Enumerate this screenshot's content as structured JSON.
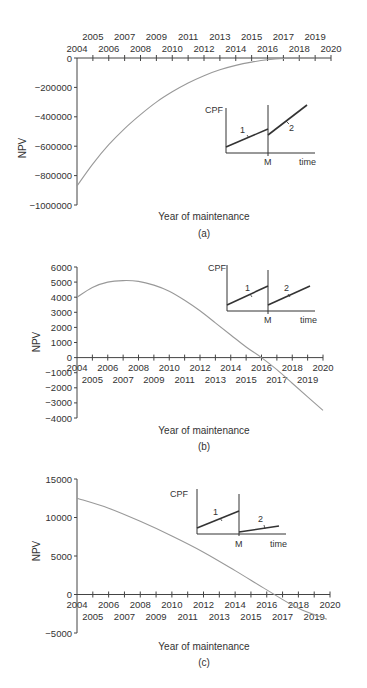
{
  "chart_data": [
    {
      "panel": "(a)",
      "type": "line",
      "title": "",
      "xlabel": "Year of maintenance",
      "ylabel": "NPV",
      "caption": "(a)",
      "x_tick_labels_row1": [
        "2005",
        "2007",
        "2009",
        "2011",
        "2013",
        "2015",
        "2017",
        "2019"
      ],
      "x_tick_labels_row2": [
        "2004",
        "2006",
        "2008",
        "2010",
        "2012",
        "2014",
        "2016",
        "2018",
        "2020"
      ],
      "x_axis_position": "top (at y=0)",
      "y_ticks": [
        0,
        -200000,
        -400000,
        -600000,
        -800000,
        -1000000
      ],
      "y_tick_labels": [
        "0",
        "−200000",
        "−400000",
        "−600000",
        "−800000",
        "−1000000"
      ],
      "xlim": [
        2004,
        2020
      ],
      "ylim": [
        -1000000,
        0
      ],
      "grid": false,
      "x": [
        2004,
        2005,
        2006,
        2007,
        2008,
        2009,
        2010,
        2011,
        2012,
        2013,
        2014,
        2015,
        2016,
        2017,
        2018,
        2019
      ],
      "values": [
        -870000,
        -720000,
        -590000,
        -480000,
        -385000,
        -300000,
        -230000,
        -170000,
        -120000,
        -80000,
        -50000,
        -28000,
        -12000,
        -3000,
        0,
        0
      ],
      "inset": {
        "ylabel": "CPF",
        "xlabel": "time",
        "marker": "M",
        "segments": [
          {
            "label": "1",
            "description": "before maintenance, moderate slope"
          },
          {
            "label": "2",
            "description": "after maintenance, drops at M then steeper slope"
          }
        ]
      }
    },
    {
      "panel": "(b)",
      "type": "line",
      "title": "",
      "xlabel": "Year of maintenance",
      "ylabel": "NPV",
      "caption": "(b)",
      "x_tick_labels_row1": [
        "2004",
        "2006",
        "2008",
        "2010",
        "2012",
        "2014",
        "2016",
        "2018",
        "2020"
      ],
      "x_tick_labels_row2": [
        "2005",
        "2007",
        "2009",
        "2011",
        "2013",
        "2015",
        "2017",
        "2019"
      ],
      "x_axis_position": "at y=0",
      "y_ticks": [
        6000,
        5000,
        4000,
        3000,
        2000,
        1000,
        0,
        -1000,
        -2000,
        -3000,
        -4000
      ],
      "y_tick_labels": [
        "6000",
        "5000",
        "4000",
        "3000",
        "2000",
        "1000",
        "0",
        "−1000",
        "−2000",
        "−3000",
        "−4000"
      ],
      "xlim": [
        2004,
        2020
      ],
      "ylim": [
        -4000,
        6000
      ],
      "grid": false,
      "x": [
        2004,
        2005,
        2006,
        2007,
        2008,
        2009,
        2010,
        2011,
        2012,
        2013,
        2014,
        2015,
        2016,
        2017,
        2018,
        2019,
        2020
      ],
      "values": [
        4000,
        4650,
        5000,
        5100,
        5050,
        4800,
        4400,
        3800,
        3100,
        2300,
        1500,
        700,
        0,
        -800,
        -1700,
        -2600,
        -3500
      ],
      "inset": {
        "ylabel": "CPF",
        "xlabel": "time",
        "marker": "M",
        "segments": [
          {
            "label": "1",
            "description": "before maintenance"
          },
          {
            "label": "2",
            "description": "after maintenance, drops at M then same slope"
          }
        ]
      }
    },
    {
      "panel": "(c)",
      "type": "line",
      "title": "",
      "xlabel": "Year of maintenance",
      "ylabel": "NPV",
      "caption": "(c)",
      "x_tick_labels_row1": [
        "2004",
        "2006",
        "2008",
        "2010",
        "2012",
        "2014",
        "2016",
        "2018",
        "2020"
      ],
      "x_tick_labels_row2": [
        "2005",
        "2007",
        "2009",
        "2011",
        "2013",
        "2015",
        "2017",
        "2019"
      ],
      "x_axis_position": "at y=0",
      "y_ticks": [
        15000,
        10000,
        5000,
        0,
        -5000
      ],
      "y_tick_labels": [
        "15000",
        "10000",
        "5000",
        "0",
        "−5000"
      ],
      "xlim": [
        2004,
        2020
      ],
      "ylim": [
        -5000,
        15000
      ],
      "grid": false,
      "x": [
        2004,
        2006,
        2008,
        2010,
        2012,
        2014,
        2016,
        2018,
        2019.8
      ],
      "values": [
        12500,
        11200,
        9500,
        7600,
        5500,
        3100,
        600,
        -1800,
        -3200
      ],
      "inset": {
        "ylabel": "CPF",
        "xlabel": "time",
        "marker": "M",
        "segments": [
          {
            "label": "1",
            "description": "before maintenance"
          },
          {
            "label": "2",
            "description": "after maintenance, drops at M then shallower slope"
          }
        ]
      }
    }
  ],
  "labels": {
    "a": {
      "xlabel": "Year of maintenance",
      "ylabel": "NPV",
      "caption": "(a)",
      "inset_y": "CPF",
      "inset_x": "time",
      "inset_m": "M",
      "seg1": "1",
      "seg2": "2"
    },
    "b": {
      "xlabel": "Year of maintenance",
      "ylabel": "NPV",
      "caption": "(b)",
      "inset_y": "CPF",
      "inset_x": "time",
      "inset_m": "M",
      "seg1": "1",
      "seg2": "2"
    },
    "c": {
      "xlabel": "Year of maintenance",
      "ylabel": "NPV",
      "caption": "(c)",
      "inset_y": "CPF",
      "inset_x": "time",
      "inset_m": "M",
      "seg1": "1",
      "seg2": "2"
    }
  }
}
